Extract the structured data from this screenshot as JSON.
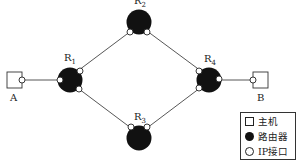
{
  "diagram": {
    "type": "network-topology",
    "hosts": [
      {
        "id": "A",
        "label": "A"
      },
      {
        "id": "B",
        "label": "B"
      }
    ],
    "routers": [
      {
        "id": "R1",
        "name": "R",
        "sub": "1"
      },
      {
        "id": "R2",
        "name": "R",
        "sub": "2"
      },
      {
        "id": "R3",
        "name": "R",
        "sub": "3"
      },
      {
        "id": "R4",
        "name": "R",
        "sub": "4"
      }
    ],
    "links": [
      [
        "A",
        "R1"
      ],
      [
        "R1",
        "R2"
      ],
      [
        "R1",
        "R3"
      ],
      [
        "R2",
        "R4"
      ],
      [
        "R3",
        "R4"
      ],
      [
        "R4",
        "B"
      ]
    ],
    "colors": {
      "router": "#111111",
      "line": "#444444",
      "interface_fill": "#ffffff"
    }
  },
  "legend": {
    "items": [
      {
        "symbol": "host-square",
        "label": "主机"
      },
      {
        "symbol": "router-disc",
        "label": "路由器"
      },
      {
        "symbol": "ip-interface-circle",
        "label": "IP接口"
      }
    ]
  }
}
